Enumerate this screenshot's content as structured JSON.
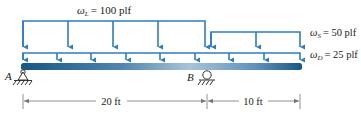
{
  "loads": {
    "live": {
      "symbol": "ω",
      "sub": "L",
      "value": "= 100 plf"
    },
    "snow": {
      "symbol": "ω",
      "sub": "S",
      "value": "= 50 plf"
    },
    "dead": {
      "symbol": "ω",
      "sub": "D",
      "value": "= 25 plf"
    }
  },
  "supports": {
    "a": {
      "label": "A",
      "type": "pin"
    },
    "b": {
      "label": "B",
      "type": "roller"
    }
  },
  "dimensions": {
    "span_ab": "20 ft",
    "overhang": "10 ft"
  },
  "colors": {
    "load": "#2e7dbf",
    "beam_dark": "#1a5a88",
    "beam_light": "#9dbbd3",
    "text": "#222222",
    "dim": "#777777"
  }
}
